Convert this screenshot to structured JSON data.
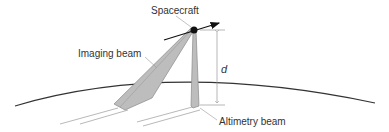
{
  "diagram": {
    "labels": {
      "spacecraft": "Spacecraft",
      "imaging_beam": "Imaging beam",
      "altimetry_beam": "Altimetry beam",
      "distance": "d"
    },
    "colors": {
      "line": "#333333",
      "beam_fill": "#bdbdbd",
      "beam_stroke": "#8a8a8a",
      "leader": "#999999",
      "spacecraft": "#111111"
    }
  }
}
